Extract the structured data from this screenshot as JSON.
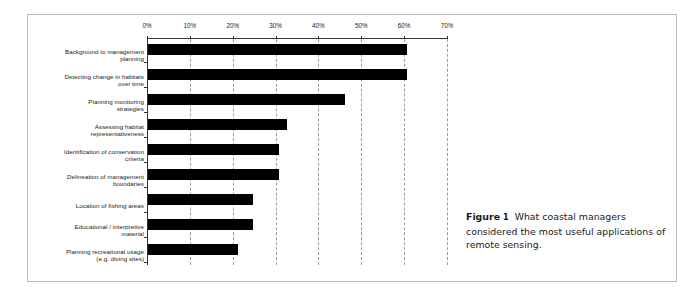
{
  "figure": {
    "caption_label": "Figure",
    "caption_number": "1",
    "caption_text": "What coastal managers considered the most useful applications of remote sensing."
  },
  "chart_data": {
    "type": "bar",
    "orientation": "horizontal",
    "title": "",
    "xlabel": "",
    "ylabel": "",
    "xlim": [
      0,
      70
    ],
    "xticks": [
      0,
      10,
      20,
      30,
      40,
      50,
      60,
      70
    ],
    "xtick_labels": [
      "0%",
      "10%",
      "20%",
      "30%",
      "40%",
      "50%",
      "60%",
      "70%"
    ],
    "grid": "vertical-dashed",
    "legend": "none",
    "bar_color": "#000000",
    "categories": [
      "Background to management\nplanning",
      "Detecting change in habitats\nover time",
      "Planning monitoring\nstrategies",
      "Assessing habitat\nrepresentativeness",
      "Identification of conservation\ncriteria",
      "Delineation of management\nboundaries",
      "Location of fishing areas",
      "Educational / interpretive\nmaterial",
      "Planning recreational usage\n(e.g. diving sites)"
    ],
    "values": [
      60.5,
      60.5,
      46,
      32.5,
      30.5,
      30.5,
      24.5,
      24.5,
      21
    ]
  }
}
